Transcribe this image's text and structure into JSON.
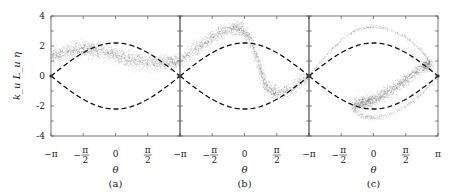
{
  "chart_data": {
    "type": "scatter",
    "layout": "three horizontally adjacent panels sharing y-axis",
    "ylabel": "k_u L_u η",
    "xlabel": "θ",
    "ylim": [
      -4,
      4
    ],
    "xlim": [
      "-π",
      "π"
    ],
    "yticks": [
      -4,
      -2,
      0,
      2,
      4
    ],
    "ytick_labels": [
      "-4",
      "-2",
      "0",
      "2",
      "4"
    ],
    "grid": false,
    "legend": null,
    "separatrix": {
      "style": "dashed black",
      "description": "η = ±2.2·cos(θ/2)",
      "amplitude": 2.2
    },
    "panels": [
      {
        "label": "(a)",
        "xtick_labels": [
          "−π",
          "−π/2",
          "0",
          "π/2",
          "−π"
        ],
        "description": "Gray particle cloud band drifting from ~1.3 at θ=−π up to ~1.8 near θ=−π/4, then down to ~0.8 at θ=π",
        "band": {
          "theta": [
            -3.14,
            -2.36,
            -1.57,
            -0.79,
            0,
            0.79,
            1.57,
            2.36,
            3.14
          ],
          "eta_center": [
            1.3,
            1.6,
            1.8,
            1.7,
            1.4,
            1.1,
            0.9,
            0.85,
            1.0
          ],
          "spread": 0.5
        }
      },
      {
        "label": "(b)",
        "xtick_labels": [
          "−π",
          "−π/2",
          "0",
          "π/2",
          "−π"
        ],
        "description": "Particle band rising from ~1 at θ=−π to peak ~3.3 near θ=−0.3, then sharp fall to ~−1.3 near θ=1.2, then back up to ~0 at θ=π",
        "band": {
          "theta": [
            -3.14,
            -2.36,
            -1.57,
            -0.79,
            -0.2,
            0.3,
            0.7,
            1.1,
            1.57,
            2.36,
            3.14
          ],
          "eta_center": [
            1.0,
            1.8,
            2.6,
            3.1,
            3.2,
            2.4,
            0.8,
            -0.8,
            -1.2,
            -0.8,
            0.0
          ],
          "spread": 0.45
        }
      },
      {
        "label": "(c)",
        "xtick_labels": [
          "π",
          "−π/2",
          "0",
          "π/2",
          "π"
        ],
        "description": "Thin outer filament spiralling from θ=−π up to ~3.3 at θ≈0, broadening near θ≈2.3 (~1.8), down through dense band to ~−2 at θ≈−0.5 and lower filament ~−2.8 near θ≈0",
        "upper_filament": {
          "theta": [
            -3.14,
            -2.36,
            -1.57,
            -0.79,
            0,
            0.79,
            1.57,
            2.36,
            2.8
          ],
          "eta": [
            0.0,
            1.3,
            2.4,
            3.1,
            3.3,
            3.1,
            2.6,
            1.7,
            0.8
          ]
        },
        "dense_band": {
          "theta": [
            2.8,
            2.36,
            1.57,
            0.79,
            0,
            -0.5,
            -1.0
          ],
          "eta": [
            0.8,
            0.6,
            -0.3,
            -1.0,
            -1.6,
            -1.8,
            -2.0
          ],
          "spread": 0.4
        },
        "lower_filament": {
          "theta": [
            -1.0,
            -0.5,
            0,
            0.79,
            1.57,
            2.36,
            3.14
          ],
          "eta": [
            -2.3,
            -2.7,
            -2.8,
            -2.6,
            -2.0,
            -1.2,
            0.0
          ]
        }
      }
    ]
  }
}
